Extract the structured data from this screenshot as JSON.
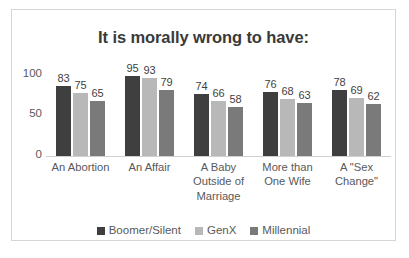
{
  "chart_data": {
    "type": "bar",
    "title": "It is morally wrong to have:",
    "xlabel": "",
    "ylabel": "",
    "ylim": [
      0,
      100
    ],
    "yticks": [
      "0",
      "50",
      "100"
    ],
    "grid": false,
    "legend_position": "bottom-center",
    "categories": [
      "An Abortion",
      "An Affair",
      "A Baby Outside of Marriage",
      "More than One Wife",
      "A \"Sex Change\""
    ],
    "series": [
      {
        "name": "Boomer/Silent",
        "color": "#3f3f3f",
        "values": [
          83,
          95,
          74,
          76,
          78
        ]
      },
      {
        "name": "GenX",
        "color": "#b8b8b8",
        "values": [
          75,
          93,
          66,
          68,
          69
        ]
      },
      {
        "name": "Millennial",
        "color": "#7a7a7a",
        "values": [
          65,
          79,
          58,
          63,
          62
        ]
      }
    ]
  },
  "category_lines": [
    [
      "An Abortion"
    ],
    [
      "An Affair"
    ],
    [
      "A Baby",
      "Outside of",
      "Marriage"
    ],
    [
      "More than",
      "One Wife"
    ],
    [
      "A \"Sex",
      "Change\""
    ]
  ]
}
